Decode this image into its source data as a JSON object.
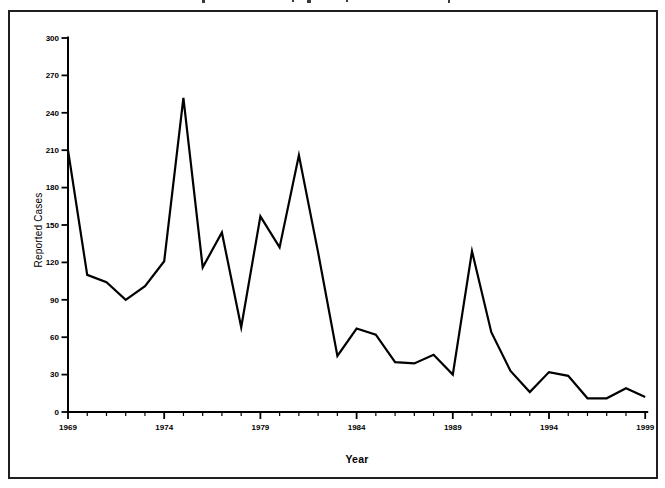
{
  "page": {
    "background": "#ffffff",
    "figure_border_color": "#1f1f1f"
  },
  "cropped_title_fragments": [
    {
      "x": 202,
      "w": 3,
      "h": 3
    },
    {
      "x": 292,
      "w": 2,
      "h": 2
    },
    {
      "x": 307,
      "w": 4,
      "h": 3
    },
    {
      "x": 346,
      "w": 2,
      "h": 2
    },
    {
      "x": 448,
      "w": 2,
      "h": 3
    }
  ],
  "chart_data": {
    "type": "line",
    "title": "",
    "xlabel": "Year",
    "ylabel": "Reported Cases",
    "x": [
      1969,
      1970,
      1971,
      1972,
      1973,
      1974,
      1975,
      1976,
      1977,
      1978,
      1979,
      1980,
      1981,
      1982,
      1983,
      1984,
      1985,
      1986,
      1987,
      1988,
      1989,
      1990,
      1991,
      1992,
      1993,
      1994,
      1995,
      1996,
      1997,
      1998,
      1999
    ],
    "values": [
      210,
      110,
      104,
      90,
      101,
      121,
      252,
      116,
      144,
      68,
      157,
      132,
      206,
      128,
      45,
      67,
      62,
      40,
      39,
      46,
      30,
      129,
      64,
      33,
      16,
      32,
      29,
      11,
      11,
      19,
      12
    ],
    "ylim": [
      0,
      300
    ],
    "y_ticks": [
      0,
      30,
      60,
      90,
      120,
      150,
      180,
      210,
      240,
      270,
      300
    ],
    "x_major_ticks": [
      1969,
      1974,
      1979,
      1984,
      1989,
      1994,
      1999
    ],
    "x_minor_tick_interval": 1,
    "grid": "off",
    "legend": "none",
    "line_color": "#000000",
    "axis_color": "#000000"
  }
}
